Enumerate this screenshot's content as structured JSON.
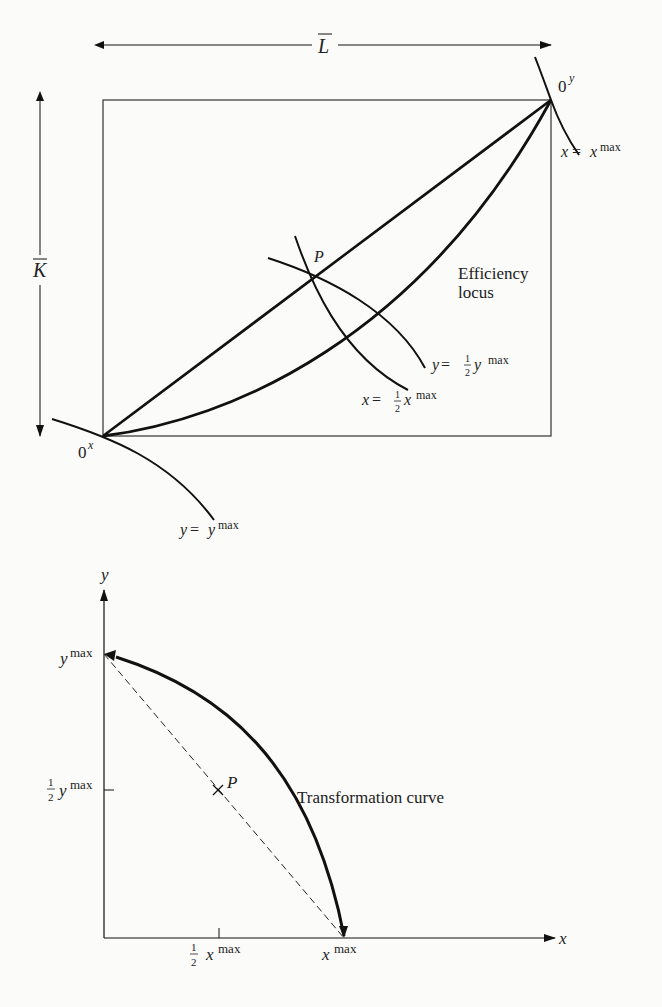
{
  "top_diagram": {
    "title": "Edgeworth box",
    "width_label": "L",
    "height_label": "K",
    "origin_x_label": "0",
    "origin_x_sup": "x",
    "origin_y_label": "0",
    "origin_y_sup": "y",
    "point_label": "P",
    "efficiency_locus_label_1": "Efficiency",
    "efficiency_locus_label_2": "locus",
    "isoquant_xmax": {
      "lhs": "x",
      "eq": " = ",
      "rhs": "x",
      "sup": "max"
    },
    "isoquant_ymax": {
      "lhs": "y",
      "eq": " = ",
      "rhs": "y",
      "sup": "max"
    },
    "isoquant_half_y": {
      "lhs": "y",
      "eq": " = ",
      "num": "1",
      "den": "2",
      "rhs": "y",
      "sup": "max"
    },
    "isoquant_half_x": {
      "lhs": "x",
      "eq": " = ",
      "num": "1",
      "den": "2",
      "rhs": "x",
      "sup": "max"
    }
  },
  "bottom_diagram": {
    "y_axis_label": "y",
    "x_axis_label": "x",
    "ymax_label": {
      "base": "y",
      "sup": "max"
    },
    "half_ymax_label": {
      "num": "1",
      "den": "2",
      "base": "y",
      "sup": "max"
    },
    "xmax_label": {
      "base": "x",
      "sup": "max"
    },
    "half_xmax_label": {
      "num": "1",
      "den": "2",
      "base": "x",
      "sup": "max"
    },
    "point_label": "P",
    "curve_label": "Transformation curve"
  },
  "colors": {
    "ink": "#111111",
    "text": "#222222",
    "background": "#fbfbfa"
  }
}
